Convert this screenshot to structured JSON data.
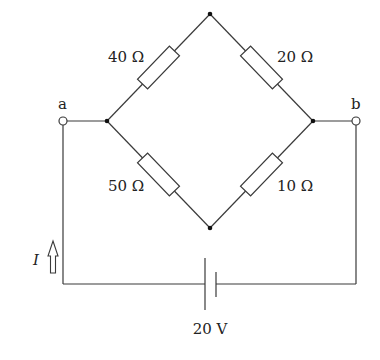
{
  "diagram": {
    "type": "wheatstone-bridge circuit",
    "resistors": [
      {
        "id": "R1",
        "label": "40 Ω",
        "between": [
          "left-node",
          "top-node"
        ]
      },
      {
        "id": "R2",
        "label": "20 Ω",
        "between": [
          "top-node",
          "right-node"
        ]
      },
      {
        "id": "R3",
        "label": "50 Ω",
        "between": [
          "left-node",
          "bottom-node"
        ]
      },
      {
        "id": "R4",
        "label": "10 Ω",
        "between": [
          "bottom-node",
          "right-node"
        ]
      }
    ],
    "terminals": [
      {
        "id": "a",
        "label": "a"
      },
      {
        "id": "b",
        "label": "b"
      }
    ],
    "source": {
      "label": "20 V",
      "type": "battery"
    },
    "current": {
      "label": "I",
      "direction": "up"
    }
  }
}
